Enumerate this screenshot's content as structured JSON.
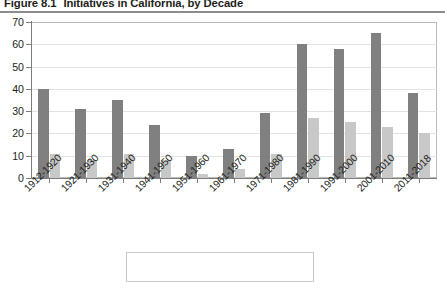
{
  "figure": {
    "number": "Figure 8.1",
    "title": "Initiatives in California, by Decade"
  },
  "chart_data": {
    "type": "bar",
    "title": "Initiatives in California, by Decade",
    "xlabel": "",
    "ylabel": "",
    "ylim": [
      0,
      70
    ],
    "ytick_step": 10,
    "yticks": [
      0,
      10,
      20,
      30,
      40,
      50,
      60,
      70
    ],
    "grid": true,
    "legend_position": "bottom",
    "categories": [
      "1912-1920",
      "1921-1930",
      "1931-1940",
      "1941-1950",
      "1951-1960",
      "1961-1970",
      "1971-1980",
      "1981-1990",
      "1991-2000",
      "2001-2010",
      "2011-2018"
    ],
    "series": [
      {
        "name": "series-1",
        "color": "#808080",
        "values": [
          40,
          31,
          35,
          24,
          10,
          13,
          29,
          60,
          58,
          65,
          38
        ]
      },
      {
        "name": "series-2",
        "color": "#c8c8c8",
        "values": [
          11,
          8,
          11,
          8,
          2,
          4,
          11,
          27,
          25,
          23,
          20
        ]
      }
    ]
  },
  "colors": {
    "series_dark": "#808080",
    "series_light": "#c8c8c8",
    "grid": "#e2e2e2",
    "axis": "#7d7d7d",
    "title_rule": "#8c8c8c"
  }
}
